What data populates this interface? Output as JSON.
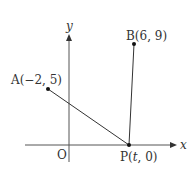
{
  "diagram": {
    "axes": {
      "x_label": "x",
      "y_label": "y",
      "origin_label": "O"
    },
    "points": [
      {
        "id": "A",
        "label": "A(−2,  5)",
        "x": -2,
        "y": 5
      },
      {
        "id": "B",
        "label": "B(6,  9)",
        "x": 6,
        "y": 9
      },
      {
        "id": "P",
        "label_prefix": "P(",
        "label_var": "t",
        "label_suffix": ",  0)"
      }
    ],
    "segments": [
      "AP",
      "BP"
    ],
    "colors": {
      "line": "#333333",
      "axis": "#555555"
    }
  }
}
